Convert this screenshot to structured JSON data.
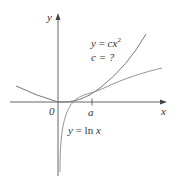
{
  "diagram": {
    "axes": {
      "x_label": "x",
      "y_label": "y",
      "origin_label": "0",
      "tick_label": "a"
    },
    "curves": [
      {
        "name": "parabola",
        "equation_lhs": "y = ",
        "equation_c": "c",
        "equation_x": "x",
        "equation_exp": "2",
        "question": "c = ?"
      },
      {
        "name": "logarithm",
        "equation_lhs": "y = ",
        "equation_fn": "ln",
        "equation_x": "x"
      }
    ],
    "colors": {
      "axis": "#555555",
      "curve": "#777777",
      "text": "#333333"
    }
  }
}
